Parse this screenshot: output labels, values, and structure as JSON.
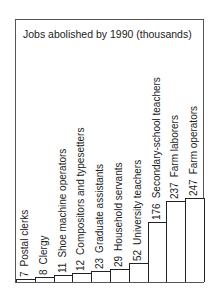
{
  "chart_data": {
    "type": "bar",
    "title": "Jobs abolished by 1990 (thousands)",
    "xlabel": "",
    "ylabel": "",
    "categories": [
      "Postal clerks",
      "Clergy",
      "Shoe machine operators",
      "Compositors and typesetters",
      "Graduate assistants",
      "Household servants",
      "University teachers",
      "Secondary-school teachers",
      "Farm laborers",
      "Farm operators"
    ],
    "values": [
      7,
      8,
      11,
      12,
      23,
      29,
      52,
      176,
      237,
      247
    ],
    "labels": [
      "7",
      "8",
      "11",
      "12",
      "23",
      "29",
      "52",
      "176",
      "237",
      "247"
    ],
    "grid": false,
    "legend": "none",
    "ylim": [
      0,
      247
    ]
  }
}
